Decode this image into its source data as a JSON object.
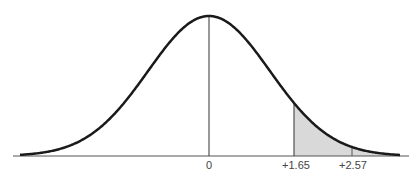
{
  "chart_data": {
    "type": "area",
    "title": "",
    "xlabel": "",
    "ylabel": "",
    "distribution": {
      "mean": 0,
      "sd": 1
    },
    "tick_labels": [
      "0",
      "+1.65",
      "+2.57"
    ],
    "ticks": [
      0,
      1.65,
      2.57
    ],
    "shaded_region": {
      "from": 1.65,
      "to": "inf"
    },
    "grid": false,
    "legend": null,
    "colors": {
      "curve": "#1a1a1a",
      "shade": "#d9d9d9",
      "axis": "#555555"
    }
  },
  "labels": {
    "zero": "0",
    "z165": "+1.65",
    "z257": "+2.57"
  }
}
